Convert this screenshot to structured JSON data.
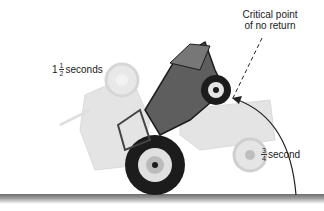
{
  "labels": {
    "critical_point": {
      "line1": "Critical point",
      "line2": "of no return"
    },
    "time_1_5": {
      "whole": "1",
      "num": "1",
      "den": "2",
      "unit": "seconds"
    },
    "time_0_75": {
      "num": "3",
      "den": "4",
      "unit": "second"
    }
  },
  "colors": {
    "ground": "#8a8a8a",
    "tractor_dark": "#1c1c1c",
    "tractor_mid": "#5a5a5a",
    "ghost": "#c8c8c8",
    "ghost_light": "#dcdcdc",
    "arc": "#222222"
  }
}
